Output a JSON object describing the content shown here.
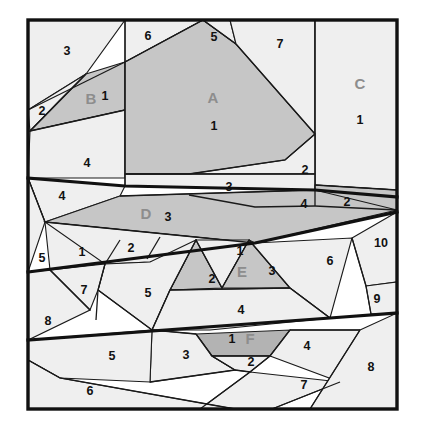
{
  "figure": {
    "name": "tangram-style-polygon-partition-diagram",
    "frame": {
      "x": 28,
      "y": 20,
      "width": 369,
      "height": 389
    },
    "colors": {
      "background": "#efefef",
      "shaded_mid": "#c6c6c6",
      "shaded_dark": "#b3b3b3",
      "stroke": "#1a1a1a",
      "heavy_stroke": "#111111",
      "number_text": "#111111",
      "group_text": "#8d8d8d",
      "page": "#ffffff"
    },
    "group_labels": [
      {
        "id": "A",
        "label": "A",
        "x": 213,
        "y": 99
      },
      {
        "id": "B",
        "label": "B",
        "x": 91,
        "y": 100
      },
      {
        "id": "C",
        "label": "C",
        "x": 360,
        "y": 85
      },
      {
        "id": "D",
        "label": "D",
        "x": 146,
        "y": 215
      },
      {
        "id": "E",
        "label": "E",
        "x": 242,
        "y": 273
      },
      {
        "id": "F",
        "label": "F",
        "x": 250,
        "y": 340
      }
    ],
    "numbers": [
      {
        "value": "3",
        "x": 67,
        "y": 52
      },
      {
        "value": "6",
        "x": 148,
        "y": 37
      },
      {
        "value": "5",
        "x": 214,
        "y": 38
      },
      {
        "value": "7",
        "x": 280,
        "y": 45
      },
      {
        "value": "2",
        "x": 42,
        "y": 112
      },
      {
        "value": "1",
        "x": 105,
        "y": 97
      },
      {
        "value": "1",
        "x": 214,
        "y": 127
      },
      {
        "value": "1",
        "x": 360,
        "y": 121
      },
      {
        "value": "4",
        "x": 87,
        "y": 164
      },
      {
        "value": "2",
        "x": 305,
        "y": 171
      },
      {
        "value": "3",
        "x": 229,
        "y": 188
      },
      {
        "value": "4",
        "x": 62,
        "y": 197
      },
      {
        "value": "4",
        "x": 304,
        "y": 205
      },
      {
        "value": "2",
        "x": 347,
        "y": 203
      },
      {
        "value": "3",
        "x": 168,
        "y": 218
      },
      {
        "value": "5",
        "x": 42,
        "y": 259
      },
      {
        "value": "1",
        "x": 82,
        "y": 253
      },
      {
        "value": "2",
        "x": 131,
        "y": 249
      },
      {
        "value": "1",
        "x": 240,
        "y": 252
      },
      {
        "value": "10",
        "x": 381,
        "y": 244
      },
      {
        "value": "2",
        "x": 212,
        "y": 280
      },
      {
        "value": "3",
        "x": 272,
        "y": 272
      },
      {
        "value": "6",
        "x": 330,
        "y": 262
      },
      {
        "value": "7",
        "x": 84,
        "y": 291
      },
      {
        "value": "5",
        "x": 148,
        "y": 294
      },
      {
        "value": "9",
        "x": 377,
        "y": 300
      },
      {
        "value": "8",
        "x": 48,
        "y": 322
      },
      {
        "value": "4",
        "x": 241,
        "y": 311
      },
      {
        "value": "1",
        "x": 232,
        "y": 340
      },
      {
        "value": "5",
        "x": 112,
        "y": 357
      },
      {
        "value": "3",
        "x": 186,
        "y": 356
      },
      {
        "value": "2",
        "x": 251,
        "y": 363
      },
      {
        "value": "4",
        "x": 307,
        "y": 347
      },
      {
        "value": "8",
        "x": 371,
        "y": 368
      },
      {
        "value": "6",
        "x": 90,
        "y": 392
      },
      {
        "value": "7",
        "x": 304,
        "y": 386
      }
    ],
    "cells": [
      {
        "name": "cell-top-left-3",
        "tone": "bg",
        "points": "28,20 125,20 86,74 28,110"
      },
      {
        "name": "cell-left-2",
        "tone": "bg",
        "points": "28,110 86,74 60,100 30,131"
      },
      {
        "name": "cell-b-quad",
        "tone": "mid",
        "points": "86,74 125,62 125,110 30,131"
      },
      {
        "name": "cell-left-4",
        "tone": "bg",
        "points": "30,131 125,110 125,178 28,178"
      },
      {
        "name": "cell-top-6",
        "tone": "bg",
        "points": "125,20 203,20 125,62"
      },
      {
        "name": "cell-a-main",
        "tone": "mid",
        "points": "203,20 236,44 315,134 315,174 189,174 125,174 125,62"
      },
      {
        "name": "cell-top-5",
        "tone": "bg",
        "points": "203,20 230,20 236,44"
      },
      {
        "name": "cell-top-7",
        "tone": "bg",
        "points": "230,20 315,20 315,134 236,44"
      },
      {
        "name": "cell-c-right",
        "tone": "bg",
        "points": "315,20 397,20 397,190 315,185"
      },
      {
        "name": "cell-right-2-small",
        "tone": "bg",
        "points": "315,134 315,174 189,174 285,160"
      },
      {
        "name": "cell-band-3",
        "tone": "bg",
        "points": "125,174 315,174 315,190 125,186"
      },
      {
        "name": "cell-band-4-right",
        "tone": "bg",
        "points": "189,195 315,190 315,206 255,207"
      },
      {
        "name": "cell-right-2-dark",
        "tone": "mid",
        "points": "315,185 397,190 397,210 315,206"
      },
      {
        "name": "cell-left-4b",
        "tone": "bg",
        "points": "28,178 125,186 120,196 45,222"
      },
      {
        "name": "cell-d-band",
        "tone": "mid",
        "points": "120,196 315,190 397,210 255,243 45,222"
      },
      {
        "name": "cell-left-5",
        "tone": "bg",
        "points": "28,178 45,222 28,272"
      },
      {
        "name": "cell-mid-1",
        "tone": "bg",
        "points": "45,222 120,240 105,264 50,270"
      },
      {
        "name": "cell-mid-2",
        "tone": "bg",
        "points": "120,240 160,237 147,259 105,264"
      },
      {
        "name": "cell-band2-left",
        "tone": "bg",
        "points": "45,222 255,243 150,262 105,264"
      },
      {
        "name": "cell-e-left-tri",
        "tone": "mid",
        "points": "196,240 222,288 170,290"
      },
      {
        "name": "cell-e-1",
        "tone": "bg",
        "points": "196,240 249,240 222,288"
      },
      {
        "name": "cell-e-right-tri",
        "tone": "mid",
        "points": "249,240 290,288 222,288"
      },
      {
        "name": "cell-mid-6",
        "tone": "bg",
        "points": "255,243 352,238 330,318 290,288 249,240"
      },
      {
        "name": "cell-mid-10",
        "tone": "bg",
        "points": "352,238 397,212 397,282 366,286"
      },
      {
        "name": "cell-mid-9",
        "tone": "bg",
        "points": "366,286 397,282 397,313 371,314"
      },
      {
        "name": "cell-mid-5",
        "tone": "bg",
        "points": "105,264 150,262 196,240 170,290 152,330 98,290"
      },
      {
        "name": "cell-mid-7",
        "tone": "bg",
        "points": "50,270 105,264 98,290 90,310"
      },
      {
        "name": "cell-mid-8",
        "tone": "bg",
        "points": "28,272 50,270 90,310 28,340"
      },
      {
        "name": "cell-mid-4",
        "tone": "bg",
        "points": "170,290 290,288 330,318 210,330 152,330"
      },
      {
        "name": "cell-f-band",
        "tone": "dark",
        "points": "196,334 290,330 270,356 212,356"
      },
      {
        "name": "cell-low-3",
        "tone": "bg",
        "points": "152,330 196,334 212,356 235,370 150,382"
      },
      {
        "name": "cell-low-5",
        "tone": "bg",
        "points": "28,340 152,330 150,382 60,378 28,360"
      },
      {
        "name": "cell-low-2",
        "tone": "bg",
        "points": "212,356 270,356 250,372 235,370"
      },
      {
        "name": "cell-low-4",
        "tone": "bg",
        "points": "290,330 360,330 340,382 270,356"
      },
      {
        "name": "cell-low-7",
        "tone": "bg",
        "points": "250,372 340,382 272,409 200,409"
      },
      {
        "name": "cell-low-8",
        "tone": "bg",
        "points": "360,330 397,313 397,409 310,409"
      },
      {
        "name": "cell-low-6",
        "tone": "bg",
        "points": "28,360 60,378 235,409 28,409"
      }
    ],
    "heavy_lines": [
      {
        "name": "heavy-line-1",
        "points": "28,178 125,186 315,190 397,197"
      },
      {
        "name": "heavy-line-2",
        "points": "28,272 255,243 397,212"
      },
      {
        "name": "heavy-line-3",
        "points": "28,340 330,318 397,313"
      }
    ],
    "thin_lines": [
      {
        "name": "line-topleft-diag",
        "points": "28,110 125,62"
      },
      {
        "name": "line-b-bottom",
        "points": "30,131 125,110"
      },
      {
        "name": "line-b-left",
        "points": "30,131 86,74"
      },
      {
        "name": "line-vert-left",
        "points": "125,20 125,186"
      },
      {
        "name": "line-vert-right",
        "points": "315,20 315,206"
      },
      {
        "name": "line-a-top-left",
        "points": "125,62 203,20"
      },
      {
        "name": "line-a-top-right",
        "points": "203,20 236,44"
      },
      {
        "name": "line-a-right",
        "points": "236,44 315,134"
      },
      {
        "name": "line-a-bottom",
        "points": "125,174 189,174 285,160 315,134"
      },
      {
        "name": "line-band3-top",
        "points": "125,174 315,174"
      },
      {
        "name": "line-band4",
        "points": "189,195 255,207 315,206"
      },
      {
        "name": "line-dark2-top",
        "points": "315,185 397,190"
      },
      {
        "name": "line-dark2-bot",
        "points": "315,206 397,210"
      },
      {
        "name": "line-left4b",
        "points": "28,178 45,222"
      },
      {
        "name": "line-d-top",
        "points": "120,196 315,190"
      },
      {
        "name": "line-d-bottom",
        "points": "45,222 255,243"
      },
      {
        "name": "line-mid1-right",
        "points": "120,240 105,264"
      },
      {
        "name": "line-mid2-right",
        "points": "160,237 147,259"
      },
      {
        "name": "line-e-left",
        "points": "196,240 170,290"
      },
      {
        "name": "line-e-mid1",
        "points": "196,240 222,288"
      },
      {
        "name": "line-e-mid2",
        "points": "249,240 222,288"
      },
      {
        "name": "line-e-right",
        "points": "249,240 290,288"
      },
      {
        "name": "line-e-bottom",
        "points": "170,290 290,288"
      },
      {
        "name": "line-6-right",
        "points": "290,288 330,318"
      },
      {
        "name": "line-10-left",
        "points": "352,238 366,286"
      },
      {
        "name": "line-9-left",
        "points": "366,286 371,314"
      },
      {
        "name": "line-7-left",
        "points": "50,270 90,310"
      },
      {
        "name": "line-7-right",
        "points": "105,264 98,290 96,320"
      },
      {
        "name": "line-5-right",
        "points": "98,290 152,330"
      },
      {
        "name": "line-mid5-left",
        "points": "170,290 152,330"
      },
      {
        "name": "line-f-left",
        "points": "196,334 212,356"
      },
      {
        "name": "line-f-right",
        "points": "290,330 270,356"
      },
      {
        "name": "line-f-bottom",
        "points": "212,356 270,356"
      },
      {
        "name": "line-low3-right",
        "points": "212,356 235,370 150,382"
      },
      {
        "name": "line-low2-right",
        "points": "270,356 250,372 235,370"
      },
      {
        "name": "line-low5-bottom",
        "points": "28,360 60,378 235,409"
      },
      {
        "name": "line-low4-right",
        "points": "290,330 360,330"
      },
      {
        "name": "line-low7-left",
        "points": "250,372 200,409"
      },
      {
        "name": "line-low4-bot",
        "points": "340,382 272,409"
      },
      {
        "name": "line-low8-left",
        "points": "360,330 310,409"
      },
      {
        "name": "line-low3-to-f",
        "points": "152,330 196,334"
      }
    ]
  }
}
